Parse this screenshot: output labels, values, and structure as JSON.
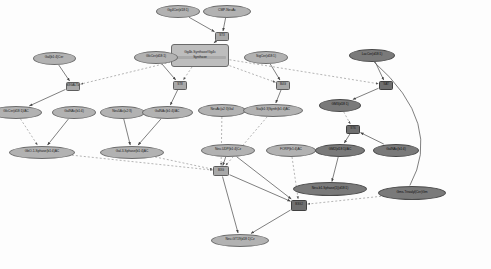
{
  "diagram": {
    "background_color": "#fdfdfd",
    "node_fill_light": "#b2b2b2",
    "node_fill_dark": "#7a7a7a",
    "reaction_fill": "#a8a8a8",
    "edge_color": "#555555",
    "dashed_edge_color": "#8d8d8d"
  },
  "nodes": [
    {
      "id": "n01",
      "label": "Gg4Cer(d18:1)",
      "type": "metabolite",
      "shade": "light",
      "x": 178,
      "y": 11,
      "w": 44,
      "h": 13
    },
    {
      "id": "n02",
      "label": "CMP-NeuAc",
      "type": "metabolite",
      "shade": "light",
      "x": 227,
      "y": 11,
      "w": 48,
      "h": 13
    },
    {
      "id": "n03",
      "label": "ST3",
      "type": "reaction",
      "shade": "light",
      "x": 222,
      "y": 36,
      "w": 14,
      "h": 9
    },
    {
      "id": "n04l1",
      "label": "Gg4b-Synthase/Gg4c",
      "line2": "Synthase",
      "type": "complex",
      "shade": "light",
      "x": 200,
      "y": 55,
      "w": 58,
      "h": 23
    },
    {
      "id": "n05",
      "label": "Gal(b1:4)Cer",
      "type": "metabolite",
      "shade": "light",
      "x": 54,
      "y": 58,
      "w": 43,
      "h": 13
    },
    {
      "id": "n06",
      "label": "GlcCer(d18:1)",
      "type": "metabolite",
      "shade": "light",
      "x": 156,
      "y": 57,
      "w": 44,
      "h": 13
    },
    {
      "id": "n07",
      "label": "SigCer(d18:1)",
      "type": "metabolite",
      "shade": "light",
      "x": 266,
      "y": 57,
      "w": 44,
      "h": 13
    },
    {
      "id": "n08",
      "label": "LacCer(d18:1)",
      "type": "metabolite",
      "shade": "dark",
      "x": 372,
      "y": 55,
      "w": 46,
      "h": 13
    },
    {
      "id": "n09",
      "label": "B3GALT4",
      "type": "reaction",
      "shade": "light",
      "x": 73,
      "y": 86,
      "w": 14,
      "h": 9
    },
    {
      "id": "n10",
      "label": "ST8",
      "type": "reaction",
      "shade": "light",
      "x": 180,
      "y": 85,
      "w": 14,
      "h": 9
    },
    {
      "id": "n11",
      "label": "B4G",
      "type": "reaction",
      "shade": "light",
      "x": 283,
      "y": 85,
      "w": 14,
      "h": 9
    },
    {
      "id": "n12",
      "label": "SAT",
      "type": "reaction",
      "shade": "dark",
      "x": 386,
      "y": 85,
      "w": 14,
      "h": 9
    },
    {
      "id": "n13",
      "label": "GlcCer(d18:1)/AC",
      "type": "metabolite",
      "shade": "light",
      "x": 16,
      "y": 112,
      "w": 52,
      "h": 13
    },
    {
      "id": "n14",
      "label": "GalNAc(b1:4)",
      "type": "metabolite",
      "shade": "light",
      "x": 74,
      "y": 112,
      "w": 44,
      "h": 13
    },
    {
      "id": "n15",
      "label": "Neu5Ac(a2:3)",
      "type": "metabolite",
      "shade": "light",
      "x": 122,
      "y": 112,
      "w": 45,
      "h": 13
    },
    {
      "id": "n16",
      "label": "GalNAc(b1:4)/AC",
      "type": "metabolite",
      "shade": "light",
      "x": 167,
      "y": 112,
      "w": 51,
      "h": 13
    },
    {
      "id": "n17",
      "label": "NeuAc(a2:3)Gal",
      "type": "metabolite",
      "shade": "light",
      "x": 222,
      "y": 110,
      "w": 48,
      "h": 13
    },
    {
      "id": "n18",
      "label": "Sia(b1:3)Synth(b1:4)AC",
      "type": "metabolite",
      "shade": "light",
      "x": 273,
      "y": 110,
      "w": 60,
      "h": 13
    },
    {
      "id": "n19",
      "label": "GM3(d18:1)",
      "type": "metabolite",
      "shade": "dark",
      "x": 340,
      "y": 105,
      "w": 42,
      "h": 13
    },
    {
      "id": "n20",
      "label": "ST6",
      "type": "reaction",
      "shade": "dark",
      "x": 353,
      "y": 129,
      "w": 14,
      "h": 9
    },
    {
      "id": "n21",
      "label": "GbO-1-Sphase(b1:4)AC",
      "type": "metabolite",
      "shade": "light",
      "x": 42,
      "y": 152,
      "w": 66,
      "h": 13
    },
    {
      "id": "n22",
      "label": "Gal-3-Sphase(b1:4)AC",
      "type": "metabolite",
      "shade": "light",
      "x": 132,
      "y": 152,
      "w": 64,
      "h": 13
    },
    {
      "id": "n23",
      "label": "Neu-UDP(b1:4)Cz",
      "type": "metabolite",
      "shade": "light",
      "x": 228,
      "y": 150,
      "w": 54,
      "h": 13
    },
    {
      "id": "n24",
      "label": "FORP(b1:4)AC",
      "type": "metabolite",
      "shade": "light",
      "x": 291,
      "y": 150,
      "w": 50,
      "h": 13
    },
    {
      "id": "n25",
      "label": "GM2(d18:1)/AC",
      "type": "metabolite",
      "shade": "dark",
      "x": 340,
      "y": 150,
      "w": 50,
      "h": 13
    },
    {
      "id": "n26",
      "label": "GalNAc(b1:4)",
      "type": "metabolite",
      "shade": "dark",
      "x": 396,
      "y": 150,
      "w": 46,
      "h": 13
    },
    {
      "id": "n27",
      "label": "B3G",
      "type": "reaction",
      "shade": "light",
      "x": 221,
      "y": 171,
      "w": 16,
      "h": 10
    },
    {
      "id": "n28",
      "label": "Neu-b1-Sphase(1)(d18:1)",
      "type": "metabolite",
      "shade": "dark",
      "x": 330,
      "y": 189,
      "w": 74,
      "h": 14
    },
    {
      "id": "n29",
      "label": "Gms-Trisialyl(Cer)Gm",
      "type": "metabolite",
      "shade": "dark",
      "x": 412,
      "y": 193,
      "w": 68,
      "h": 14
    },
    {
      "id": "n30",
      "label": "B3G2",
      "type": "reaction",
      "shade": "dark",
      "x": 299,
      "y": 205,
      "w": 16,
      "h": 11
    },
    {
      "id": "n31",
      "label": "Neu-GT19(d18:1)Cz",
      "type": "metabolite",
      "shade": "light",
      "x": 240,
      "y": 240,
      "w": 58,
      "h": 13
    }
  ],
  "edges": [
    {
      "from": "n01",
      "to": "n03",
      "style": "solid",
      "arrow": true
    },
    {
      "from": "n02",
      "to": "n03",
      "style": "solid",
      "arrow": true
    },
    {
      "from": "n03",
      "to": "n04l1",
      "style": "solid",
      "arrow": true
    },
    {
      "from": "n05",
      "to": "n09",
      "style": "solid",
      "arrow": true
    },
    {
      "from": "n06",
      "to": "n10",
      "style": "solid",
      "arrow": true
    },
    {
      "from": "n07",
      "to": "n11",
      "style": "solid",
      "arrow": true
    },
    {
      "from": "n08",
      "to": "n12",
      "style": "solid",
      "arrow": true
    },
    {
      "from": "n04l1",
      "to": "n09",
      "style": "dashed",
      "arrow": true
    },
    {
      "from": "n04l1",
      "to": "n10",
      "style": "dashed",
      "arrow": true
    },
    {
      "from": "n04l1",
      "to": "n11",
      "style": "dashed",
      "arrow": true
    },
    {
      "from": "n04l1",
      "to": "n12",
      "style": "dashed",
      "arrow": true
    },
    {
      "from": "n09",
      "to": "n13",
      "style": "solid",
      "arrow": true
    },
    {
      "from": "n10",
      "to": "n16",
      "style": "solid",
      "arrow": true
    },
    {
      "from": "n11",
      "to": "n18",
      "style": "solid",
      "arrow": true
    },
    {
      "from": "n12",
      "to": "n19",
      "style": "solid",
      "arrow": true
    },
    {
      "from": "n13",
      "to": "n21",
      "style": "dashed",
      "arrow": true
    },
    {
      "from": "n14",
      "to": "n21",
      "style": "solid",
      "arrow": true
    },
    {
      "from": "n15",
      "to": "n22",
      "style": "solid",
      "arrow": true
    },
    {
      "from": "n16",
      "to": "n22",
      "style": "solid",
      "arrow": true
    },
    {
      "from": "n17",
      "to": "n27",
      "style": "dashed",
      "arrow": true
    },
    {
      "from": "n18",
      "to": "n27",
      "style": "dashed",
      "arrow": true
    },
    {
      "from": "n19",
      "to": "n20",
      "style": "dashed",
      "arrow": true
    },
    {
      "from": "n20",
      "to": "n25",
      "style": "solid",
      "arrow": true
    },
    {
      "from": "n26",
      "to": "n20",
      "style": "solid",
      "arrow": true
    },
    {
      "from": "n25",
      "to": "n28",
      "style": "solid",
      "arrow": true
    },
    {
      "from": "n21",
      "to": "n27",
      "style": "dashed",
      "arrow": true
    },
    {
      "from": "n22",
      "to": "n27",
      "style": "dashed",
      "arrow": true
    },
    {
      "from": "n23",
      "to": "n27",
      "style": "solid",
      "arrow": true
    },
    {
      "from": "n24",
      "to": "n30",
      "style": "dashed",
      "arrow": true
    },
    {
      "from": "n23",
      "to": "n30",
      "style": "solid",
      "arrow": true
    },
    {
      "from": "n27",
      "to": "n31",
      "style": "solid",
      "arrow": true
    },
    {
      "from": "n30",
      "to": "n31",
      "style": "solid",
      "arrow": true
    },
    {
      "from": "n27",
      "to": "n30",
      "style": "solid",
      "arrow": true
    },
    {
      "from": "n29",
      "to": "n30",
      "style": "dashed",
      "arrow": true
    },
    {
      "from": "n08",
      "to": "n29",
      "style": "curve",
      "arrow": false
    }
  ]
}
